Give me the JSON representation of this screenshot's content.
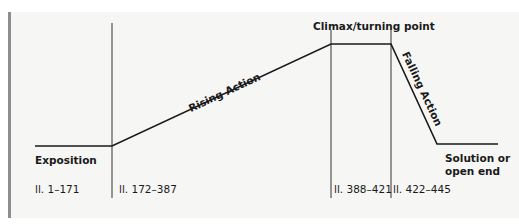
{
  "diagram": {
    "type": "plot-structure-line",
    "stages": [
      {
        "id": "exposition",
        "label": "Exposition",
        "lines": "ll. 1–171"
      },
      {
        "id": "rising",
        "label": "Rising Action",
        "lines": "ll. 172–387"
      },
      {
        "id": "climax",
        "label": "Climax/turning point",
        "lines": "ll. 388–421"
      },
      {
        "id": "falling",
        "label": "Falling Action",
        "lines": "ll. 422–445"
      },
      {
        "id": "solution",
        "label_line1": "Solution or",
        "label_line2": "open end"
      }
    ],
    "colors": {
      "line": "#1a1a1a",
      "panel": "#f6f6f5",
      "bar": "#8e8e8e"
    }
  }
}
